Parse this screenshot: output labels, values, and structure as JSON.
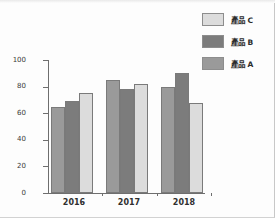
{
  "chart_data": {
    "type": "bar",
    "title": "",
    "subtitle": "",
    "xlabel": "",
    "ylabel": "",
    "categories": [
      "2016",
      "2017",
      "2018"
    ],
    "series": [
      {
        "name": "產品 A",
        "color": "#9a9a9a",
        "values": [
          65,
          69,
          75
        ]
      },
      {
        "name": "產品 B",
        "color": "#7c7c7c",
        "values": [
          85,
          78,
          82
        ]
      },
      {
        "name": "產品 C",
        "color": "#dcdcdc",
        "values": [
          80,
          90,
          68
        ]
      }
    ],
    "bar_order_in_group": [
      "產品 A",
      "產品 B",
      "產品 C"
    ],
    "group_values": {
      "2016": {
        "產品 A": 65,
        "產品 B": 69,
        "產品 C": 75
      },
      "2017": {
        "產品 A": 85,
        "產品 B": 78,
        "產品 C": 82
      },
      "2018": {
        "產品 A": 80,
        "產品 B": 90,
        "產品 C": 68
      }
    },
    "ylim": [
      0,
      100
    ],
    "ytick_values": [
      0,
      20,
      40,
      60,
      80,
      100
    ],
    "ytick_labels": [
      "0",
      "20",
      "40",
      "60",
      "80",
      "100"
    ],
    "grid": false,
    "legend_position": "top-right",
    "legend_entries": [
      {
        "label": "產品 C",
        "color": "#dcdcdc"
      },
      {
        "label": "產品 B",
        "color": "#7c7c7c"
      },
      {
        "label": "產品 A",
        "color": "#9a9a9a"
      }
    ]
  },
  "axis": {
    "line_color": "#6e6e6e"
  },
  "page": {
    "background": "#fdfdfd"
  }
}
